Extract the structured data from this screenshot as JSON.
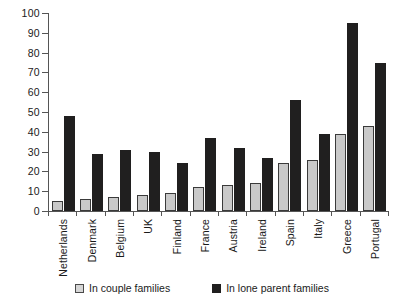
{
  "chart_data": {
    "type": "bar",
    "title": "",
    "subtitle": "",
    "xlabel": "",
    "ylabel": "",
    "ylim": [
      0,
      100
    ],
    "yticks": [
      0,
      10,
      20,
      30,
      40,
      50,
      60,
      70,
      80,
      90,
      100
    ],
    "grid": false,
    "legend_position": "bottom",
    "categories": [
      "Netherlands",
      "Denmark",
      "Belgium",
      "UK",
      "Finland",
      "France",
      "Austria",
      "Ireland",
      "Spain",
      "Italy",
      "Greece",
      "Portugal"
    ],
    "series": [
      {
        "name": "In couple families",
        "color": "#c9c9c9",
        "values": [
          5,
          6,
          7,
          8,
          9,
          12,
          13,
          14,
          24,
          26,
          39,
          43
        ]
      },
      {
        "name": "In lone parent families",
        "color": "#201f1f",
        "values": [
          48,
          29,
          31,
          30,
          24,
          37,
          32,
          27,
          56,
          39,
          95,
          75
        ]
      }
    ]
  },
  "legend": {
    "items": [
      {
        "label": "In couple families",
        "marker": "square-outline-light"
      },
      {
        "label": "In lone parent families",
        "marker": "square-solid-dark"
      }
    ]
  }
}
